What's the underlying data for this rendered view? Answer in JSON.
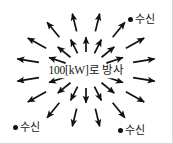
{
  "figure": {
    "width": 173,
    "height": 144,
    "background_color": "#ffffff",
    "ink_color": "#111111",
    "border_color": "#d8d8d8"
  },
  "center": {
    "label": "100[kW]로 방사",
    "power_value": "100",
    "power_unit": "[kW]"
  },
  "receivers": [
    {
      "id": "top-right",
      "label": "수신",
      "marker": "filled-dot"
    },
    {
      "id": "bottom-left",
      "label": "수신",
      "marker": "filled-dot"
    },
    {
      "id": "bottom-right",
      "label": "수신",
      "marker": "filled-dot"
    }
  ],
  "arrows": {
    "direction": "outward-radial",
    "count": 32,
    "rings": [
      {
        "name": "inner",
        "count": 16,
        "inner_radius": 22,
        "outer_radius": 40
      },
      {
        "name": "outer",
        "count": 16,
        "inner_radius": 48,
        "outer_radius": 70
      }
    ],
    "center_x": 86,
    "center_y": 70
  }
}
